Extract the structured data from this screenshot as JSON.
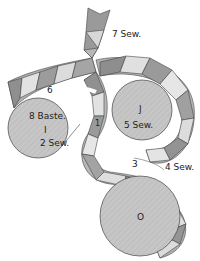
{
  "diagram": {
    "colors": {
      "circle_fill": "#c4c4c4",
      "dark_seg": "#8f8f8f",
      "mid_seg": "#b5b5b5",
      "light_seg": "#e4e4e4",
      "stroke": "#444444"
    },
    "circles": [
      {
        "id": "I",
        "letter": "I",
        "notes": [
          "8 Baste.",
          "2 Sew."
        ]
      },
      {
        "id": "J",
        "letter": "J",
        "notes": [
          "5 Sew."
        ]
      },
      {
        "id": "O",
        "letter": "O",
        "notes": []
      }
    ],
    "step_labels": {
      "s1": "1",
      "s3": "3",
      "s4": "4 Sew.",
      "s6": "6",
      "s7": "7 Sew."
    }
  }
}
